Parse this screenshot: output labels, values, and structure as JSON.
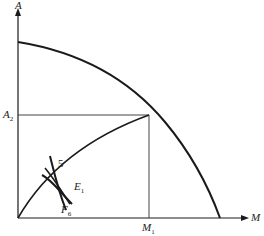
{
  "diagram": {
    "type": "production-possibility-frontier",
    "axes": {
      "y_label": "A",
      "x_label": "M"
    },
    "labels": {
      "a2": {
        "main": "A",
        "sub": "2"
      },
      "m1": {
        "main": "M",
        "sub": "1"
      },
      "point_5": "5",
      "e1": {
        "main": "E",
        "sub": "1"
      },
      "f6": {
        "main": "F",
        "sub": "6"
      }
    },
    "colors": {
      "stroke": "#1a1a1a",
      "guide": "#444444",
      "background": "#ffffff"
    }
  }
}
